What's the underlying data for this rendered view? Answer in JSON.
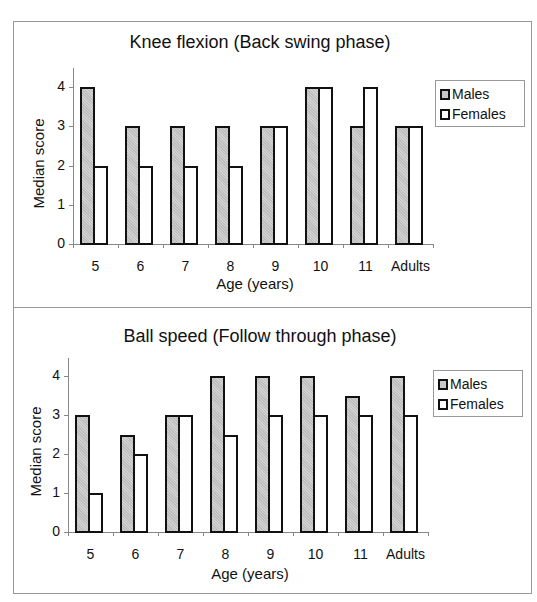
{
  "chart_data": [
    {
      "type": "bar",
      "title": "Knee flexion (Back swing phase)",
      "xlabel": "Age (years)",
      "ylabel": "Median score",
      "categories": [
        "5",
        "6",
        "7",
        "8",
        "9",
        "10",
        "11",
        "Adults"
      ],
      "series": [
        {
          "name": "Males",
          "values": [
            4,
            3,
            3,
            3,
            3,
            4,
            3,
            3
          ],
          "color": "#c8c8c8"
        },
        {
          "name": "Females",
          "values": [
            2,
            2,
            2,
            2,
            3,
            4,
            4,
            3
          ],
          "color": "#ffffff"
        }
      ],
      "yticks": [
        "0",
        "1",
        "2",
        "3",
        "4"
      ],
      "ylim": [
        0,
        4.5
      ],
      "grid": false,
      "legend_position": "right"
    },
    {
      "type": "bar",
      "title": "Ball speed (Follow through phase)",
      "xlabel": "Age (years)",
      "ylabel": "Median score",
      "categories": [
        "5",
        "6",
        "7",
        "8",
        "9",
        "10",
        "11",
        "Adults"
      ],
      "series": [
        {
          "name": "Males",
          "values": [
            3,
            2.5,
            3,
            4,
            4,
            4,
            3.5,
            4
          ],
          "color": "#c8c8c8"
        },
        {
          "name": "Females",
          "values": [
            1,
            2,
            3,
            2.5,
            3,
            3,
            3,
            3
          ],
          "color": "#ffffff"
        }
      ],
      "yticks": [
        "0",
        "1",
        "2",
        "3",
        "4"
      ],
      "ylim": [
        0,
        4.5
      ],
      "grid": false,
      "legend_position": "right"
    }
  ]
}
